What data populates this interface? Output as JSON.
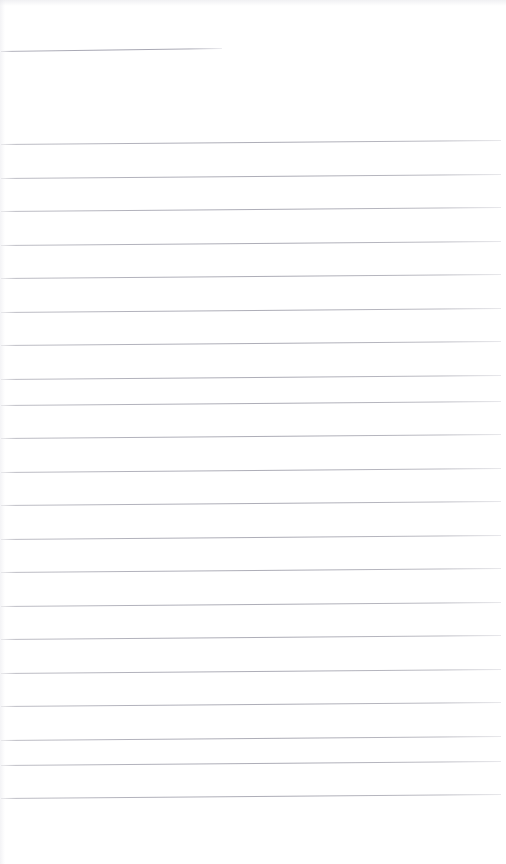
{
  "document": {
    "kind": "scanned-ruled-notebook-page",
    "title": "Blank Ruled Page",
    "content_text": "",
    "page_width": 506,
    "page_height": 864,
    "background_color": "#ffffff",
    "rule_color": "#b0b0ba"
  },
  "header_rule": {
    "name": "header-underline",
    "x_start": 1,
    "x_end": 222,
    "y_left": 51,
    "y_right": 48,
    "width": 221
  },
  "body_rules": {
    "count": 20,
    "x_start": 1,
    "x_end": 501,
    "spacing": 33.5,
    "first_y_left": 144,
    "slant_rise": 4,
    "lines": [
      {
        "index": 1,
        "y_left": 144.0,
        "y_right": 140.0
      },
      {
        "index": 2,
        "y_left": 177.5,
        "y_right": 173.5
      },
      {
        "index": 3,
        "y_left": 211.0,
        "y_right": 207.0
      },
      {
        "index": 4,
        "y_left": 244.5,
        "y_right": 240.5
      },
      {
        "index": 5,
        "y_left": 278.0,
        "y_right": 274.0
      },
      {
        "index": 6,
        "y_left": 311.5,
        "y_right": 307.5
      },
      {
        "index": 7,
        "y_left": 345.0,
        "y_right": 341.0
      },
      {
        "index": 8,
        "y_left": 378.5,
        "y_right": 374.5
      },
      {
        "index": 9,
        "y_left": 404.5,
        "y_right": 400.5
      },
      {
        "index": 10,
        "y_left": 438.0,
        "y_right": 434.0
      },
      {
        "index": 11,
        "y_left": 471.5,
        "y_right": 467.5
      },
      {
        "index": 12,
        "y_left": 505.0,
        "y_right": 501.0
      },
      {
        "index": 13,
        "y_left": 538.5,
        "y_right": 534.5
      },
      {
        "index": 14,
        "y_left": 572.0,
        "y_right": 568.0
      },
      {
        "index": 15,
        "y_left": 605.5,
        "y_right": 601.5
      },
      {
        "index": 16,
        "y_left": 639.0,
        "y_right": 635.0
      },
      {
        "index": 17,
        "y_left": 672.5,
        "y_right": 668.5
      },
      {
        "index": 18,
        "y_left": 706.0,
        "y_right": 702.0
      },
      {
        "index": 19,
        "y_left": 739.5,
        "y_right": 735.5
      },
      {
        "index": 20,
        "y_left": 765.0,
        "y_right": 761.0
      },
      {
        "index": 21,
        "y_left": 798.0,
        "y_right": 794.0
      }
    ]
  }
}
